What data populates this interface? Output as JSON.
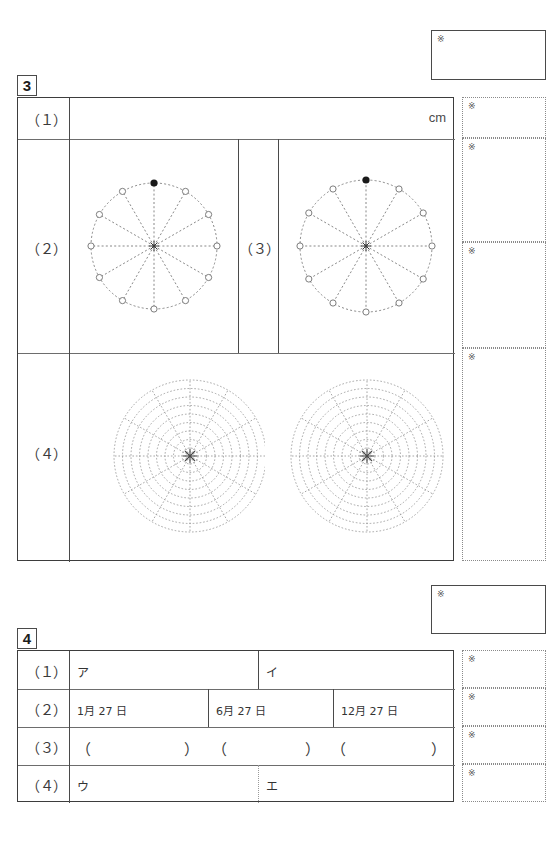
{
  "page": {
    "width": 551,
    "height": 847,
    "background": "#ffffff",
    "line_color": "#6d6d6d",
    "border_color": "#3d3d3d",
    "dotted_color": "#8a8a8a",
    "ink_color": "#333333"
  },
  "marks": {
    "kome_symbol": "※"
  },
  "sections": [
    {
      "id": "section-3",
      "number": "3",
      "total_box": {
        "mark": "※"
      },
      "rows": [
        {
          "label": "（１）",
          "kind": "unit-answer",
          "cells": [
            {
              "value": "",
              "unit": "cm"
            }
          ],
          "score_mark": "※"
        },
        {
          "label": "（２）",
          "kind": "clock-diagram",
          "second_label": "（３）",
          "diagram": {
            "type": "12-point-circle",
            "points": 12,
            "filled_point_index": 0,
            "radial_lines": 12,
            "center_marker": "asterisk"
          },
          "score_mark": "※"
        },
        {
          "label": "（４）",
          "kind": "polar-grid",
          "diagram": {
            "type": "polar-grid",
            "rings": 9,
            "radial_lines": 12,
            "center_marker": "asterisk"
          },
          "score_mark": "※"
        }
      ],
      "score_cells": [
        {
          "mark": "※"
        },
        {
          "mark": "※"
        },
        {
          "mark": "※"
        },
        {
          "mark": "※"
        }
      ]
    },
    {
      "id": "section-4",
      "number": "4",
      "total_box": {
        "mark": "※"
      },
      "rows": [
        {
          "label": "（１）",
          "cells": [
            {
              "value": "ア"
            },
            {
              "value": "イ"
            }
          ]
        },
        {
          "label": "（２）",
          "cells": [
            {
              "value": "1月 27 日"
            },
            {
              "value": "6月 27 日"
            },
            {
              "value": "12月 27 日"
            }
          ]
        },
        {
          "label": "（３）",
          "cells": [
            {
              "open": "（",
              "close": "）"
            },
            {
              "open": "（",
              "close": "）"
            },
            {
              "open": "（",
              "close": "）"
            }
          ]
        },
        {
          "label": "（４）",
          "cells": [
            {
              "value": "ウ"
            },
            {
              "value": "エ"
            }
          ]
        }
      ],
      "score_cells": [
        {
          "mark": "※"
        },
        {
          "mark": "※"
        },
        {
          "mark": "※"
        },
        {
          "mark": "※"
        }
      ]
    }
  ]
}
